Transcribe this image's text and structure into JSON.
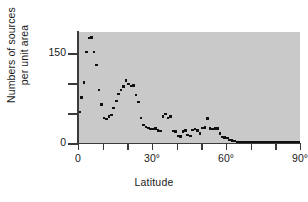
{
  "chart_data": {
    "type": "scatter",
    "title": "",
    "xlabel": "Latitude",
    "ylabel_lines": [
      "Numbers of sources",
      "per unit area"
    ],
    "ylabel": "Numbers of sources per unit area",
    "xlim": [
      0,
      90
    ],
    "ylim": [
      0,
      185
    ],
    "xticks": [
      0,
      10,
      20,
      30,
      40,
      50,
      60,
      70,
      80,
      90
    ],
    "xtick_labels": [
      "0",
      "",
      "",
      "30°",
      "",
      "",
      "60°",
      "",
      "",
      "90°"
    ],
    "yticks": [
      0,
      50,
      100,
      150
    ],
    "ytick_labels": [
      "0",
      "",
      "",
      "150"
    ],
    "grid": false,
    "legend": false,
    "plot_background": "#c9c9c9",
    "marker_color": "#101010",
    "axis_color": "#3a3a3a",
    "x": [
      0.5,
      1.5,
      2.5,
      3.5,
      4.5,
      5.5,
      6.5,
      7.5,
      8.5,
      9.5,
      10.5,
      11.5,
      12.5,
      13.5,
      14.5,
      15.5,
      16.5,
      17.5,
      18.5,
      19.5,
      20.5,
      21.5,
      22.5,
      23.5,
      24.5,
      25.5,
      26.5,
      27.5,
      28.5,
      29.5,
      30.5,
      31.5,
      32.5,
      33.5,
      34.5,
      35.5,
      36.5,
      37.5,
      38.5,
      39.5,
      40.5,
      41.5,
      42.5,
      43.5,
      44.5,
      45.5,
      46.5,
      47.5,
      48.5,
      49.5,
      50.5,
      51.5,
      52.5,
      53.5,
      54.5,
      55.5,
      56.5,
      57.5,
      58.5,
      59.5,
      60.5,
      61.5,
      62.5,
      63.5,
      64.5,
      65.5,
      66.5,
      67.5,
      68.5,
      69.5,
      70.5,
      71.5,
      72.5,
      73.5,
      74.5,
      75.5,
      76.5,
      77.5,
      78.5,
      79.5,
      80.5,
      81.5,
      82.5,
      83.5,
      84.5,
      85.5,
      86.5,
      87.5,
      88.5,
      89.5
    ],
    "y": [
      52,
      76,
      101,
      152,
      175,
      176,
      152,
      130,
      88,
      64,
      42,
      40,
      44,
      47,
      58,
      70,
      82,
      88,
      94,
      104,
      98,
      95,
      96,
      80,
      68,
      42,
      30,
      27,
      25,
      23,
      23,
      24,
      21,
      20,
      44,
      48,
      42,
      44,
      20,
      19,
      12,
      11,
      19,
      21,
      13,
      12,
      22,
      23,
      21,
      16,
      25,
      26,
      41,
      24,
      23,
      24,
      24,
      16,
      10,
      9,
      8,
      5,
      4,
      3,
      2,
      2,
      2,
      2,
      2,
      2,
      2,
      2,
      2,
      2,
      2,
      2,
      2,
      2,
      2,
      2,
      2,
      2,
      2,
      2,
      2,
      2,
      2,
      2,
      2,
      2
    ]
  }
}
